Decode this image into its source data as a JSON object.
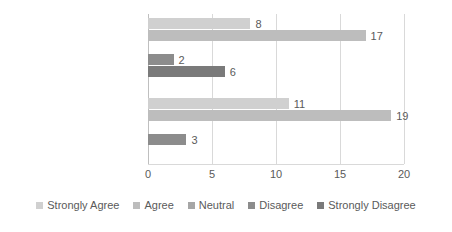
{
  "chart_data": {
    "type": "bar",
    "orientation": "horizontal",
    "title": "",
    "xlabel": "",
    "ylabel": "",
    "xlim": [
      0,
      20
    ],
    "xticks": [
      0,
      5,
      10,
      15,
      20
    ],
    "grid": true,
    "legend_position": "bottom",
    "categories": [
      "Helped provide me",
      "I better recognize the value"
    ],
    "series": [
      {
        "name": "Strongly Agree",
        "color": "#d0d0d0",
        "values": [
          8,
          11
        ]
      },
      {
        "name": "Agree",
        "color": "#bdbdbd",
        "values": [
          17,
          19
        ]
      },
      {
        "name": "Neutral",
        "color": "#a6a6a6",
        "values": [
          null,
          null
        ]
      },
      {
        "name": "Disagree",
        "color": "#8c8c8c",
        "values": [
          2,
          3
        ]
      },
      {
        "name": "Strongly Disagree",
        "color": "#7a7a7a",
        "values": [
          6,
          null
        ]
      }
    ],
    "data_labels": {
      "group_1": [
        "8",
        "17",
        "",
        "2",
        "6"
      ],
      "group_2": [
        "11",
        "19",
        "",
        "3",
        ""
      ]
    }
  },
  "axis": {
    "tick_labels": [
      "0",
      "5",
      "10",
      "15",
      "20"
    ]
  },
  "legend": {
    "items": [
      {
        "label": "Strongly Agree"
      },
      {
        "label": "Agree"
      },
      {
        "label": "Neutral"
      },
      {
        "label": "Disagree"
      },
      {
        "label": "Strongly Disagree"
      }
    ]
  }
}
